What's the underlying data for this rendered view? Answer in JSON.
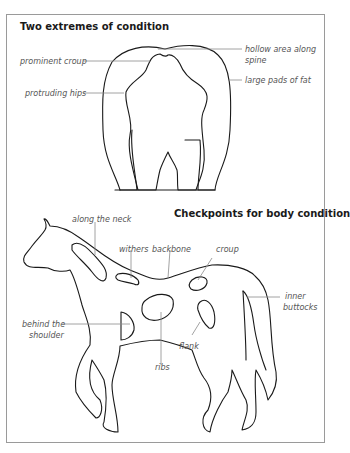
{
  "diagram": {
    "top": {
      "title": "Two extremes of condition",
      "labels": {
        "prominent_croup": "prominent croup",
        "protruding_hips": "protruding hips",
        "hollow_area_line1": "hollow area along",
        "hollow_area_line2": "spine",
        "large_pads": "large pads of fat"
      }
    },
    "bottom": {
      "title": "Checkpoints for body condition",
      "labels": {
        "along_the_neck": "along the neck",
        "withers": "withers",
        "backbone": "backbone",
        "croup": "croup",
        "inner_buttocks_line1": "inner",
        "inner_buttocks_line2": "buttocks",
        "behind_shoulder_line1": "behind the",
        "behind_shoulder_line2": "shoulder",
        "flank": "flank",
        "ribs": "ribs"
      }
    },
    "colors": {
      "outline": "#1a1a1a",
      "leader": "#8a8a8a",
      "frame": "#9a9a9a"
    }
  }
}
